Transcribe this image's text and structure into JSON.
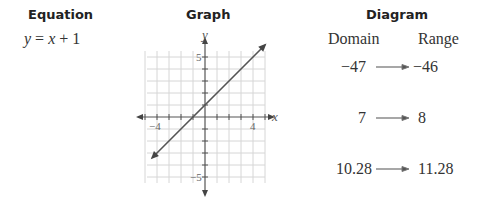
{
  "columns": {
    "equation_header": "Equation",
    "graph_header": "Graph",
    "diagram_header": "Diagram"
  },
  "equation": {
    "lhs": "y",
    "eq": " = ",
    "var": "x",
    "rest": " + 1"
  },
  "graph": {
    "x_axis_label": "x",
    "y_axis_label": "y",
    "x_tick_neg": "−4",
    "x_tick_pos": "4",
    "y_tick_pos": "5",
    "y_tick_neg": "−5"
  },
  "diagram": {
    "domain_label": "Domain",
    "range_label": "Range",
    "mappings": [
      {
        "domain": "−47",
        "range": "−46"
      },
      {
        "domain": "7",
        "range": "8"
      },
      {
        "domain": "10.28",
        "range": "11.28"
      }
    ]
  },
  "chart_data": {
    "type": "line",
    "title": "",
    "xlabel": "x",
    "ylabel": "y",
    "xlim": [
      -5,
      5
    ],
    "ylim": [
      -6,
      6
    ],
    "grid": true,
    "x_ticks_labeled": [
      -4,
      4
    ],
    "y_ticks_labeled": [
      5,
      -5
    ],
    "series": [
      {
        "name": "y = x + 1",
        "x": [
          -4.4,
          5
        ],
        "y": [
          -3.4,
          6
        ]
      }
    ]
  }
}
